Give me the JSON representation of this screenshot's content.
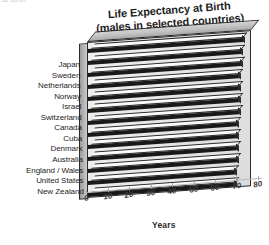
{
  "page_fragment": "at Birth",
  "chart_data": {
    "type": "bar",
    "orientation": "horizontal",
    "style": "3d-extruded",
    "title": "Life Expectancy at Birth",
    "subtitle": "(males in selected countries)",
    "xlabel": "Years",
    "ylabel": "",
    "xlim": [
      0,
      80
    ],
    "xticks": [
      0,
      10,
      20,
      30,
      40,
      50,
      60,
      70,
      80
    ],
    "xtick_labels": [
      "0",
      "10",
      "20",
      "30",
      "40",
      "50",
      "60",
      "70",
      "80"
    ],
    "grid": false,
    "legend": null,
    "categories": [
      "Japan",
      "Sweden",
      "Netherlands",
      "Norway",
      "Israel",
      "Switzerland",
      "Canada",
      "Cuba",
      "Denmark",
      "Australia",
      "England / Wales",
      "United States",
      "New Zealand"
    ],
    "values": [
      76,
      75,
      75,
      74,
      74,
      74,
      74,
      73,
      73,
      73,
      73,
      72,
      72
    ],
    "colors": {
      "bar_front": "#191919",
      "bar_top": "#f9f9f9",
      "plot_background": "#e7e7e7",
      "box_outline": "#2b2b2b",
      "axis_text": "#3a3a3a"
    }
  }
}
